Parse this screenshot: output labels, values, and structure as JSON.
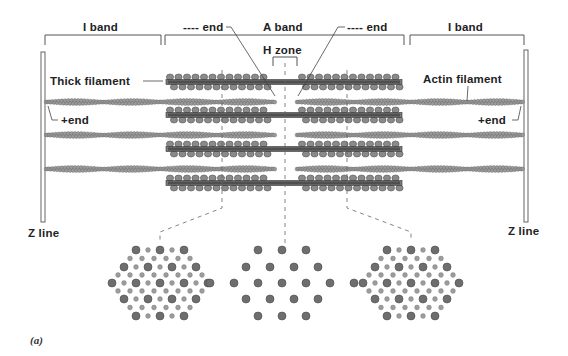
{
  "figure": {
    "panel_label": "(a)",
    "labels": {
      "i_band_left": "I band",
      "a_band": "A band",
      "i_band_right": "I band",
      "minus_end_left": "---- end",
      "minus_end_right": "---- end",
      "h_zone": "H zone",
      "thick_filament": "Thick filament",
      "actin_filament": "Actin filament",
      "plus_end_left": "+end",
      "plus_end_right": "+end",
      "z_line_left": "Z line",
      "z_line_right": "Z line"
    },
    "colors": {
      "line": "#555555",
      "myosin_head": "#8a8a8a",
      "myosin_outline": "#555555",
      "actin_bead": "#9a9a9a",
      "thick_dot": "#6e6e6e",
      "thin_dot": "#9c9c9c"
    },
    "thick_filament_rows_y": [
      82,
      115,
      149,
      183
    ],
    "actin_filament_rows_y": [
      102,
      135,
      169
    ],
    "cross_sections": [
      {
        "name": "overlap-region-left",
        "center_x": 160,
        "pattern": "thick+thin"
      },
      {
        "name": "h-zone",
        "center_x": 282,
        "pattern": "thick-only"
      },
      {
        "name": "overlap-region-right",
        "center_x": 411,
        "pattern": "thick+thin"
      }
    ]
  }
}
